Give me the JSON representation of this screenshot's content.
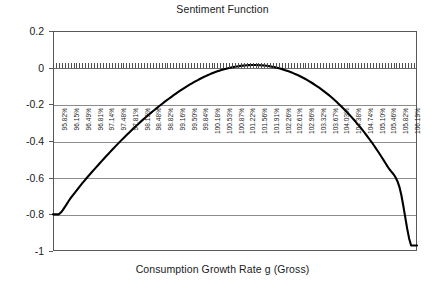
{
  "chart_data": {
    "type": "line",
    "title": "Sentiment Function",
    "xlabel": "Consumption Growth Rate g (Gross)",
    "ylabel": "",
    "ylim": [
      -1,
      0.2
    ],
    "grid": true,
    "legend": "none",
    "y_ticks": [
      "0.2",
      "0",
      "-0.2",
      "-0.4",
      "-0.6",
      "-0.8",
      "-1"
    ],
    "y_tick_values": [
      0.2,
      0,
      -0.2,
      -0.4,
      -0.6,
      -0.8,
      -1
    ],
    "categories": [
      "95.82%",
      "96.15%",
      "96.49%",
      "96.81%",
      "97.14%",
      "97.48%",
      "97.81%",
      "98.15%",
      "98.48%",
      "98.82%",
      "99.16%",
      "99.50%",
      "99.84%",
      "100.18%",
      "100.53%",
      "100.87%",
      "101.22%",
      "101.56%",
      "101.91%",
      "102.26%",
      "102.61%",
      "102.96%",
      "103.32%",
      "103.67%",
      "104.03%",
      "104.38%",
      "104.74%",
      "105.10%",
      "105.46%",
      "105.82%",
      "106.19%"
    ],
    "values": [
      -0.8,
      -0.712,
      -0.63,
      -0.556,
      -0.485,
      -0.417,
      -0.353,
      -0.293,
      -0.238,
      -0.187,
      -0.14,
      -0.098,
      -0.062,
      -0.032,
      -0.01,
      0.005,
      0.013,
      0.014,
      0.007,
      -0.008,
      -0.031,
      -0.062,
      -0.102,
      -0.15,
      -0.208,
      -0.275,
      -0.352,
      -0.44,
      -0.54,
      -0.65,
      -0.97
    ],
    "series_name": "Sentiment",
    "line_color": "#000000",
    "gridline_color": "#8c8c8c",
    "border_color": "#595959",
    "background_color": "#ffffff"
  }
}
